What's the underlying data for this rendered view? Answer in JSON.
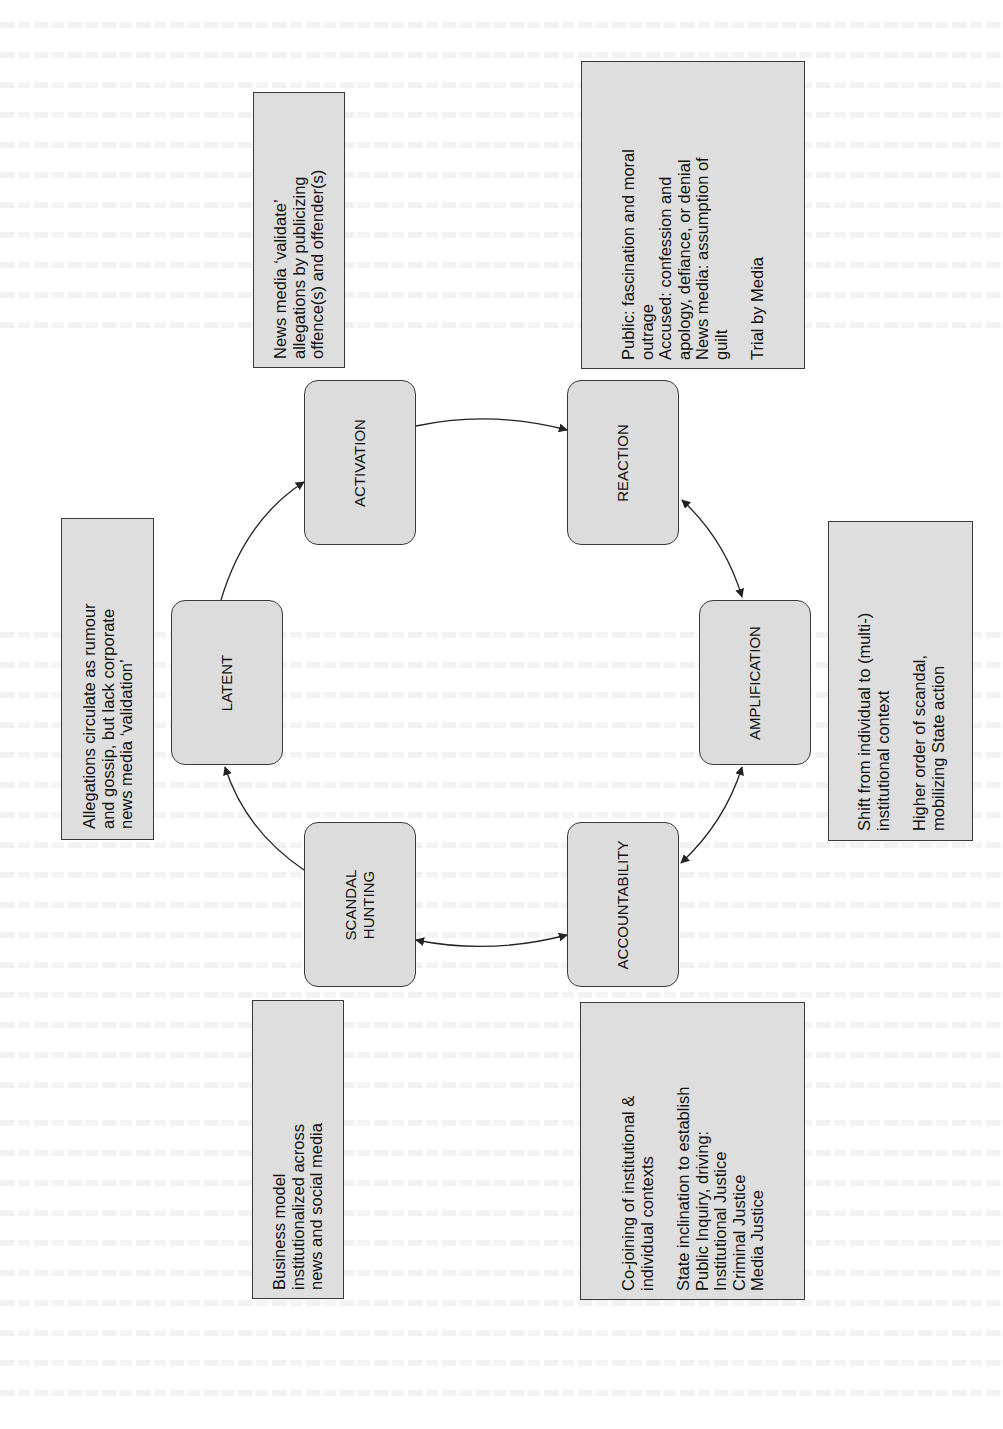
{
  "figure": {
    "orientation": "rotated-90-ccw",
    "colors": {
      "stage_fill": "#dcdcdc",
      "note_fill": "#dedede",
      "border": "#3a3a3a",
      "arrow": "#222222",
      "page_background": "#ffffff"
    },
    "stages": [
      {
        "id": "latent",
        "label": "LATENT"
      },
      {
        "id": "activation",
        "label": "ACTIVATION"
      },
      {
        "id": "reaction",
        "label": "REACTION"
      },
      {
        "id": "amplification",
        "label": "AMPLIFICATION"
      },
      {
        "id": "accountability",
        "label": "ACCOUNTABILITY"
      },
      {
        "id": "scandal_hunting",
        "label": "SCANDAL\nHUNTING"
      }
    ],
    "notes": {
      "latent": {
        "lines": [
          "Allegations circulate as rumour",
          "and gossip, but lack corporate",
          "news media ‘validation’"
        ]
      },
      "activation": {
        "lines": [
          "News media ‘validate’",
          "allegations by publicizing",
          "offence(s) and offender(s)"
        ]
      },
      "reaction": {
        "lines": [
          "Public: fascination and moral",
          "outrage",
          "Accused: confession and",
          "apology, defiance, or denial",
          "News media: assumption of",
          "guilt"
        ],
        "lines2": [
          "Trial by Media"
        ]
      },
      "amplification": {
        "lines": [
          "Shift from individual to (multi-)",
          "institutional context"
        ],
        "lines2": [
          "Higher order of scandal,",
          "mobilizing State action"
        ]
      },
      "accountability": {
        "lines": [
          "Co-joining of institutional &",
          "individual contexts"
        ],
        "lines2": [
          "State inclination to establish",
          "Public Inquiry, driving:",
          "Institutional Justice",
          "Criminal Justice",
          "Media Justice"
        ]
      },
      "scandal_hunting": {
        "lines": [
          "Business model",
          "institutionalized across",
          "news and social media"
        ]
      }
    },
    "connections": [
      {
        "from": "LATENT",
        "to": "ACTIVATION",
        "type": "single-arrow"
      },
      {
        "from": "ACTIVATION",
        "to": "REACTION",
        "type": "single-arrow"
      },
      {
        "from": "REACTION",
        "to": "AMPLIFICATION",
        "type": "double-arrow"
      },
      {
        "from": "AMPLIFICATION",
        "to": "ACCOUNTABILITY",
        "type": "double-arrow"
      },
      {
        "from": "ACCOUNTABILITY",
        "to": "SCANDAL HUNTING",
        "type": "double-arrow"
      },
      {
        "from": "SCANDAL HUNTING",
        "to": "LATENT",
        "type": "single-arrow"
      }
    ]
  }
}
